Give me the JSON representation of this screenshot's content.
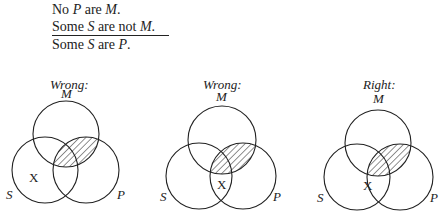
{
  "syllogism": {
    "lines": [
      {
        "pre": "No ",
        "term1": "P",
        "mid": " are ",
        "term2": "M",
        "post": "."
      },
      {
        "pre": "Some ",
        "term1": "S",
        "mid": " are not ",
        "term2": "M",
        "post": "."
      },
      {
        "pre": "Some ",
        "term1": "S",
        "mid": " are ",
        "term2": "P",
        "post": "."
      }
    ]
  },
  "diagrams": [
    {
      "caption": "Wrong:",
      "labels": {
        "m": "M",
        "s": "S",
        "p": "P",
        "x": "X"
      }
    },
    {
      "caption": "Wrong:",
      "labels": {
        "m": "M",
        "s": "S",
        "p": "P",
        "x": "X"
      }
    },
    {
      "caption": "Right:",
      "labels": {
        "m": "M",
        "s": "S",
        "p": "P",
        "x": "X"
      }
    }
  ]
}
